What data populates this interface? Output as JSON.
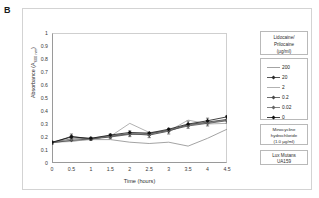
{
  "panel": {
    "label": "B"
  },
  "chart_data": {
    "type": "line",
    "title": "",
    "xlabel": "Time (hours)",
    "ylabel_text": "Absorbance (A",
    "ylabel_sub": "600 nm",
    "ylabel_tail": ")",
    "xlim": [
      0,
      4.5
    ],
    "ylim": [
      0,
      1
    ],
    "grid": false,
    "legend_position": "right",
    "x": [
      0,
      0.5,
      1,
      1.5,
      2,
      2.5,
      3,
      3.5,
      4,
      4.5
    ],
    "xticks": [
      "0",
      "0.5",
      "1",
      "1.5",
      "2",
      "2.5",
      "3",
      "3.5",
      "4",
      "4.5"
    ],
    "yticks": [
      "0",
      "0.1",
      "0.2",
      "0.3",
      "0.4",
      "0.5",
      "0.6",
      "0.7",
      "0.8",
      "0.9",
      "1"
    ],
    "series": [
      {
        "name": "200",
        "marker": "none",
        "color": "#8c8c8c",
        "values": [
          0.16,
          0.17,
          0.18,
          0.18,
          0.16,
          0.15,
          0.16,
          0.13,
          0.19,
          0.26
        ]
      },
      {
        "name": "20",
        "marker": "filled-diamond",
        "color": "#2b2b2b",
        "values": [
          0.155,
          0.205,
          0.185,
          0.205,
          0.225,
          0.215,
          0.245,
          0.295,
          0.315,
          0.335
        ],
        "errors": [
          0.012,
          0.018,
          0.012,
          0.018,
          0.022,
          0.02,
          0.022,
          0.028,
          0.03,
          0.03
        ]
      },
      {
        "name": "2",
        "marker": "none",
        "color": "#9e9e9e",
        "values": [
          0.16,
          0.165,
          0.185,
          0.205,
          0.305,
          0.235,
          0.245,
          0.33,
          0.3,
          0.305
        ]
      },
      {
        "name": "0.2",
        "marker": "filled-diamond",
        "color": "#4a4a4a",
        "values": [
          0.155,
          0.175,
          0.185,
          0.2,
          0.22,
          0.225,
          0.25,
          0.285,
          0.305,
          0.325
        ]
      },
      {
        "name": "0.02",
        "marker": "filled-diamond",
        "color": "#666666",
        "values": [
          0.16,
          0.185,
          0.19,
          0.21,
          0.225,
          0.22,
          0.255,
          0.29,
          0.31,
          0.33
        ]
      },
      {
        "name": "0",
        "marker": "filled-diamond",
        "color": "#111111",
        "values": [
          0.16,
          0.2,
          0.19,
          0.215,
          0.235,
          0.23,
          0.26,
          0.3,
          0.325,
          0.355
        ]
      }
    ]
  },
  "legend": {
    "title_line1": "Lidocaine/",
    "title_line2": "Prilocaine",
    "title_line3": "(µg/ml)",
    "items": [
      {
        "label": "200"
      },
      {
        "label": "20"
      },
      {
        "label": "2"
      },
      {
        "label": "0.2"
      },
      {
        "label": "0.02"
      },
      {
        "label": "0"
      }
    ],
    "control_line1": "Minocycline",
    "control_line2": "hydrochloride",
    "control_line3": "(1.0 µg/ml)",
    "strain_line1": "Lux Mutans",
    "strain_line2": "UA159"
  },
  "colors": {
    "axis": "#9a9a9a",
    "frame": "#d3d3d3",
    "text": "#2b2b2b"
  }
}
